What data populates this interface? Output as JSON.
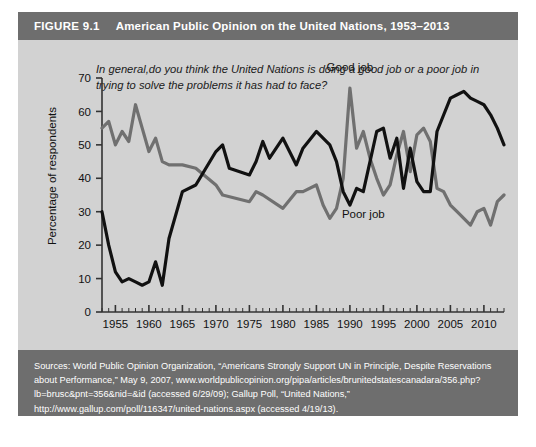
{
  "figure": {
    "number_label": "FIGURE 9.1",
    "title": "American Public Opinion on the United Nations, 1953–2013",
    "question": "In general,do you think the United Nations is doing a good job or a poor job in trying to solve the problems it has had to face?",
    "sources": "Sources: World Public Opinion Organization, “Americans Strongly Support UN in Principle, Despite Reservations about Performance,” May 9, 2007, www.worldpublicopinion.org/pipa/articles/brunitedstatescanadara/356.php?lb=brusc&pnt=356&nid=&id (accessed 6/29/09); Gallup Poll, “United Nations,” http://www.gallup.com/poll/116347/united-nations.aspx (accessed 4/19/13)."
  },
  "colors": {
    "header_bar": "#6e6e6e",
    "card_background": "#d2d2d2",
    "good_job_line": "#707070",
    "poor_job_line": "#111111",
    "axis": "#333333"
  },
  "chart_data": {
    "type": "line",
    "title": "American Public Opinion on the United Nations, 1953–2013",
    "subtitle": "In general,do you think the United Nations is doing a good job or a poor job in trying to solve the problems it has had to face?",
    "xlabel": "",
    "ylabel": "Percentage of respondents",
    "xlim": [
      1953,
      2013
    ],
    "ylim": [
      0,
      70
    ],
    "yticks": [
      0,
      10,
      20,
      30,
      40,
      50,
      60,
      70
    ],
    "xticks": [
      1955,
      1960,
      1965,
      1970,
      1975,
      1980,
      1985,
      1990,
      1995,
      2000,
      2005,
      2010
    ],
    "minor_xtick_interval": 1,
    "grid": false,
    "legend": "inline-annotations",
    "annotations": [
      {
        "text": "Good job",
        "x": 1990,
        "y": 72
      },
      {
        "text": "Poor job",
        "x": 1992,
        "y": 28
      }
    ],
    "series": [
      {
        "name": "Good job",
        "color": "#707070",
        "points": [
          {
            "x": 1953,
            "y": 55
          },
          {
            "x": 1954,
            "y": 57
          },
          {
            "x": 1955,
            "y": 50
          },
          {
            "x": 1956,
            "y": 54
          },
          {
            "x": 1957,
            "y": 51
          },
          {
            "x": 1958,
            "y": 62
          },
          {
            "x": 1959,
            "y": 55
          },
          {
            "x": 1960,
            "y": 48
          },
          {
            "x": 1961,
            "y": 52
          },
          {
            "x": 1962,
            "y": 45
          },
          {
            "x": 1963,
            "y": 44
          },
          {
            "x": 1965,
            "y": 44
          },
          {
            "x": 1967,
            "y": 43
          },
          {
            "x": 1970,
            "y": 38
          },
          {
            "x": 1971,
            "y": 35
          },
          {
            "x": 1975,
            "y": 33
          },
          {
            "x": 1976,
            "y": 36
          },
          {
            "x": 1977,
            "y": 35
          },
          {
            "x": 1980,
            "y": 31
          },
          {
            "x": 1982,
            "y": 36
          },
          {
            "x": 1983,
            "y": 36
          },
          {
            "x": 1985,
            "y": 38
          },
          {
            "x": 1986,
            "y": 32
          },
          {
            "x": 1987,
            "y": 28
          },
          {
            "x": 1988,
            "y": 31
          },
          {
            "x": 1989,
            "y": 40
          },
          {
            "x": 1990,
            "y": 67
          },
          {
            "x": 1991,
            "y": 49
          },
          {
            "x": 1992,
            "y": 54
          },
          {
            "x": 1993,
            "y": 46
          },
          {
            "x": 1994,
            "y": 40
          },
          {
            "x": 1995,
            "y": 35
          },
          {
            "x": 1996,
            "y": 38
          },
          {
            "x": 1997,
            "y": 47
          },
          {
            "x": 1998,
            "y": 54
          },
          {
            "x": 1999,
            "y": 42
          },
          {
            "x": 2000,
            "y": 53
          },
          {
            "x": 2001,
            "y": 55
          },
          {
            "x": 2002,
            "y": 51
          },
          {
            "x": 2003,
            "y": 37
          },
          {
            "x": 2004,
            "y": 36
          },
          {
            "x": 2005,
            "y": 32
          },
          {
            "x": 2006,
            "y": 30
          },
          {
            "x": 2007,
            "y": 28
          },
          {
            "x": 2008,
            "y": 26
          },
          {
            "x": 2009,
            "y": 30
          },
          {
            "x": 2010,
            "y": 31
          },
          {
            "x": 2011,
            "y": 26
          },
          {
            "x": 2012,
            "y": 33
          },
          {
            "x": 2013,
            "y": 35
          }
        ]
      },
      {
        "name": "Poor job",
        "color": "#111111",
        "points": [
          {
            "x": 1953,
            "y": 30
          },
          {
            "x": 1954,
            "y": 20
          },
          {
            "x": 1955,
            "y": 12
          },
          {
            "x": 1956,
            "y": 9
          },
          {
            "x": 1957,
            "y": 10
          },
          {
            "x": 1958,
            "y": 9
          },
          {
            "x": 1959,
            "y": 8
          },
          {
            "x": 1960,
            "y": 9
          },
          {
            "x": 1961,
            "y": 15
          },
          {
            "x": 1962,
            "y": 8
          },
          {
            "x": 1963,
            "y": 22
          },
          {
            "x": 1965,
            "y": 36
          },
          {
            "x": 1967,
            "y": 38
          },
          {
            "x": 1970,
            "y": 48
          },
          {
            "x": 1971,
            "y": 50
          },
          {
            "x": 1972,
            "y": 43
          },
          {
            "x": 1975,
            "y": 41
          },
          {
            "x": 1976,
            "y": 45
          },
          {
            "x": 1977,
            "y": 51
          },
          {
            "x": 1978,
            "y": 46
          },
          {
            "x": 1980,
            "y": 52
          },
          {
            "x": 1982,
            "y": 44
          },
          {
            "x": 1983,
            "y": 49
          },
          {
            "x": 1985,
            "y": 54
          },
          {
            "x": 1986,
            "y": 52
          },
          {
            "x": 1987,
            "y": 50
          },
          {
            "x": 1988,
            "y": 45
          },
          {
            "x": 1989,
            "y": 36
          },
          {
            "x": 1990,
            "y": 32
          },
          {
            "x": 1991,
            "y": 37
          },
          {
            "x": 1992,
            "y": 36
          },
          {
            "x": 1993,
            "y": 45
          },
          {
            "x": 1994,
            "y": 54
          },
          {
            "x": 1995,
            "y": 55
          },
          {
            "x": 1996,
            "y": 46
          },
          {
            "x": 1997,
            "y": 52
          },
          {
            "x": 1998,
            "y": 37
          },
          {
            "x": 1999,
            "y": 49
          },
          {
            "x": 2000,
            "y": 39
          },
          {
            "x": 2001,
            "y": 36
          },
          {
            "x": 2002,
            "y": 36
          },
          {
            "x": 2003,
            "y": 54
          },
          {
            "x": 2004,
            "y": 59
          },
          {
            "x": 2005,
            "y": 64
          },
          {
            "x": 2006,
            "y": 65
          },
          {
            "x": 2007,
            "y": 66
          },
          {
            "x": 2008,
            "y": 64
          },
          {
            "x": 2009,
            "y": 63
          },
          {
            "x": 2010,
            "y": 62
          },
          {
            "x": 2011,
            "y": 59
          },
          {
            "x": 2012,
            "y": 55
          },
          {
            "x": 2013,
            "y": 50
          }
        ]
      }
    ]
  }
}
